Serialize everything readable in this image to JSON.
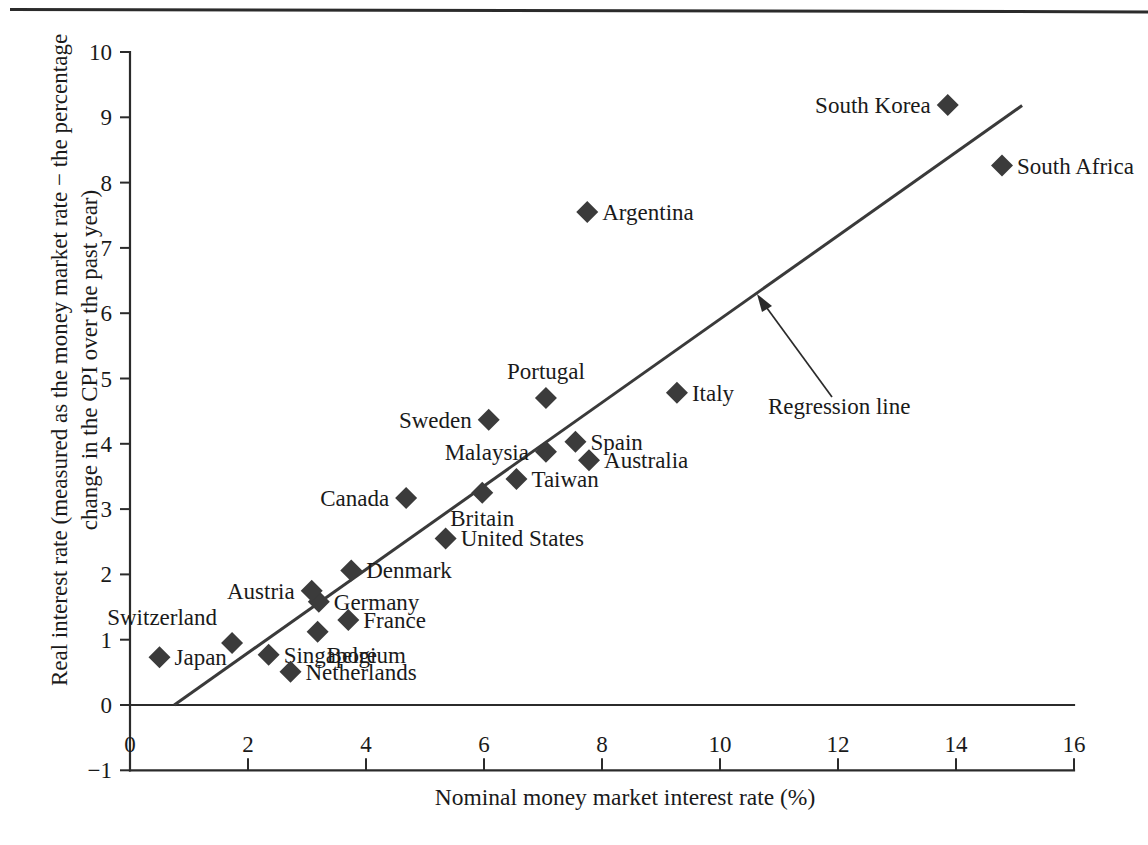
{
  "figure": {
    "y_axis_label_line1": "Real interest rate (measured as the money market rate − the percentage",
    "y_axis_label_line2": "change in the CPI over the past year)",
    "x_axis_label": "Nominal money market interest rate (%)",
    "annotation": "Regression line"
  },
  "chart_data": {
    "type": "scatter",
    "title": "",
    "xlabel": "Nominal money market interest rate (%)",
    "ylabel": "Real interest rate (measured as the money market rate − the percentage change in the CPI over the past year)",
    "xlim": [
      0,
      16
    ],
    "ylim": [
      -1,
      10
    ],
    "xticks": [
      "0",
      "2",
      "4",
      "6",
      "8",
      "10",
      "12",
      "14",
      "16"
    ],
    "xtick_values": [
      0,
      2,
      4,
      6,
      8,
      10,
      12,
      14,
      16
    ],
    "yticks": [
      "−1",
      "0",
      "1",
      "2",
      "3",
      "4",
      "5",
      "6",
      "7",
      "8",
      "9",
      "10"
    ],
    "ytick_values": [
      -1,
      0,
      1,
      2,
      3,
      4,
      5,
      6,
      7,
      8,
      9,
      10
    ],
    "grid": false,
    "legend": false,
    "marker": "diamond",
    "marker_color": "#3b3b3b",
    "points": [
      {
        "label": "Japan",
        "x": 0.5,
        "y": 0.73,
        "label_pos": "right"
      },
      {
        "label": "Switzerland",
        "x": 1.73,
        "y": 0.95,
        "label_pos": "above-left"
      },
      {
        "label": "Singapore",
        "x": 2.35,
        "y": 0.77,
        "label_pos": "right"
      },
      {
        "label": "Netherlands",
        "x": 2.72,
        "y": 0.51,
        "label_pos": "right"
      },
      {
        "label": "Germany",
        "x": 3.2,
        "y": 1.58,
        "label_pos": "right"
      },
      {
        "label": "Austria",
        "x": 3.08,
        "y": 1.75,
        "label_pos": "left"
      },
      {
        "label": "Belgium",
        "x": 3.18,
        "y": 1.12,
        "label_pos": "below-right"
      },
      {
        "label": "France",
        "x": 3.7,
        "y": 1.3,
        "label_pos": "right"
      },
      {
        "label": "Denmark",
        "x": 3.75,
        "y": 2.06,
        "label_pos": "right"
      },
      {
        "label": "Canada",
        "x": 4.68,
        "y": 3.17,
        "label_pos": "left"
      },
      {
        "label": "United States",
        "x": 5.35,
        "y": 2.55,
        "label_pos": "right"
      },
      {
        "label": "Britain",
        "x": 5.97,
        "y": 3.25,
        "label_pos": "below"
      },
      {
        "label": "Sweden",
        "x": 6.08,
        "y": 4.37,
        "label_pos": "left"
      },
      {
        "label": "Taiwan",
        "x": 6.55,
        "y": 3.46,
        "label_pos": "right"
      },
      {
        "label": "Malaysia",
        "x": 7.05,
        "y": 3.88,
        "label_pos": "left"
      },
      {
        "label": "Portugal",
        "x": 7.05,
        "y": 4.7,
        "label_pos": "above"
      },
      {
        "label": "Spain",
        "x": 7.55,
        "y": 4.03,
        "label_pos": "right"
      },
      {
        "label": "Argentina",
        "x": 7.75,
        "y": 7.55,
        "label_pos": "right"
      },
      {
        "label": "Australia",
        "x": 7.78,
        "y": 3.75,
        "label_pos": "right"
      },
      {
        "label": "Italy",
        "x": 9.27,
        "y": 4.78,
        "label_pos": "right"
      },
      {
        "label": "South Korea",
        "x": 13.86,
        "y": 9.19,
        "label_pos": "left"
      },
      {
        "label": "South Africa",
        "x": 14.78,
        "y": 8.26,
        "label_pos": "right"
      }
    ],
    "regression_line": {
      "label": "Regression line",
      "x_start": 0.75,
      "y_start": 0.0,
      "x_end": 15.12,
      "y_end": 9.18
    }
  }
}
